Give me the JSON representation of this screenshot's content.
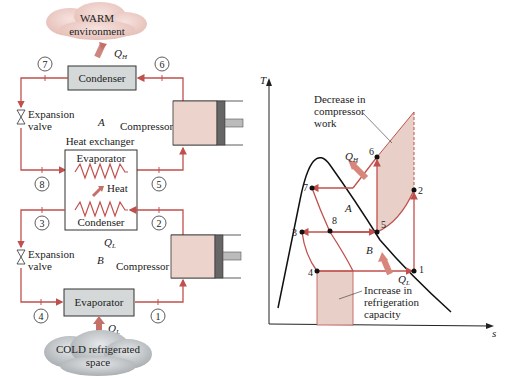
{
  "left_diagram": {
    "warm_cloud": {
      "line1": "WARM",
      "line2": "environment"
    },
    "cold_cloud": {
      "line1": "COLD refrigerated",
      "line2": "space"
    },
    "condenser_top": "Condenser",
    "evaporator_bottom": "Evaporator",
    "heat_exchanger": {
      "title": "Heat exchanger",
      "evaporator": "Evaporator",
      "condenser": "Condenser",
      "heat": "Heat"
    },
    "expansion_valve_top": {
      "line1": "Expansion",
      "line2": "valve"
    },
    "expansion_valve_bottom": {
      "line1": "Expansion",
      "line2": "valve"
    },
    "compressor_top": "Compressor",
    "compressor_bottom": "Compressor",
    "region_A": "A",
    "region_B": "B",
    "QH": "Q",
    "QH_sub": "H",
    "QL_hx": "Q",
    "QL_hx_sub": "L",
    "QL_bottom": "Q",
    "QL_bottom_sub": "L",
    "states": [
      "1",
      "2",
      "3",
      "4",
      "5",
      "6",
      "7",
      "8"
    ]
  },
  "right_diagram": {
    "y_axis": "T",
    "x_axis": "s",
    "annotation_top": {
      "line1": "Decrease in",
      "line2": "compressor",
      "line3": "work"
    },
    "annotation_bottom": {
      "line1": "Increase in",
      "line2": "refrigeration",
      "line3": "capacity"
    },
    "QH": "Q",
    "QH_sub": "H",
    "QL": "Q",
    "QL_sub": "L",
    "region_A": "A",
    "region_B": "B",
    "points": [
      "1",
      "2",
      "3",
      "4",
      "5",
      "6",
      "7",
      "8"
    ]
  },
  "colors": {
    "line": "#c0504d",
    "shade": "#e8d0c8",
    "box": "#d4d8d8",
    "compressor": "#ecd4cc",
    "cloud_warm": "#efd0cc",
    "cloud_cold": "#c8cccf",
    "dome": "#111111"
  }
}
